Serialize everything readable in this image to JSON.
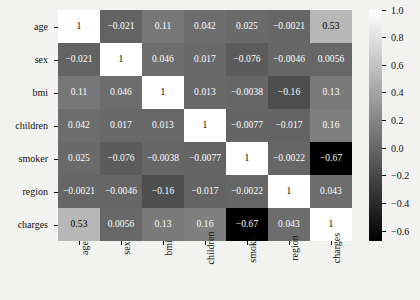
{
  "chart_data": {
    "type": "heatmap",
    "title": "",
    "xlabel": "",
    "ylabel": "",
    "grid": false,
    "colormap": "grayscale",
    "colorbar": {
      "position": "right",
      "orientation": "vertical",
      "vmin": -0.67,
      "vmax": 1.0,
      "ticks": [
        "1.0",
        "0.8",
        "0.6",
        "0.4",
        "0.2",
        "0.0",
        "−0.2",
        "−0.4",
        "−0.6"
      ],
      "tick_values": [
        1.0,
        0.8,
        0.6,
        0.4,
        0.2,
        0.0,
        -0.2,
        -0.4,
        -0.6
      ]
    },
    "categories": [
      "age",
      "sex",
      "bmi",
      "children",
      "smoker",
      "region",
      "charges"
    ],
    "xticklabels": [
      "age",
      "sex",
      "bmi",
      "children",
      "smoker",
      "region",
      "charges"
    ],
    "yticklabels": [
      "age",
      "sex",
      "bmi",
      "children",
      "smoker",
      "region",
      "charges"
    ],
    "values": [
      [
        1,
        -0.021,
        0.11,
        0.042,
        0.025,
        -0.0021,
        0.53
      ],
      [
        -0.021,
        1,
        0.046,
        0.017,
        -0.076,
        -0.0046,
        0.0056
      ],
      [
        0.11,
        0.046,
        1,
        0.013,
        -0.0038,
        -0.16,
        0.13
      ],
      [
        0.042,
        0.017,
        0.013,
        1,
        -0.0077,
        -0.017,
        0.16
      ],
      [
        0.025,
        -0.076,
        -0.0038,
        -0.0077,
        1,
        -0.0022,
        -0.67
      ],
      [
        -0.0021,
        -0.0046,
        -0.16,
        -0.017,
        -0.0022,
        1,
        0.043
      ],
      [
        0.53,
        0.0056,
        0.13,
        0.16,
        -0.67,
        0.043,
        1
      ]
    ],
    "annotations": [
      [
        "1",
        "−0.021",
        "0.11",
        "0.042",
        "0.025",
        "−0.0021",
        "0.53"
      ],
      [
        "−0.021",
        "1",
        "0.046",
        "0.017",
        "−0.076",
        "−0.0046",
        "0.0056"
      ],
      [
        "0.11",
        "0.046",
        "1",
        "0.013",
        "−0.0038",
        "−0.16",
        "0.13"
      ],
      [
        "0.042",
        "0.017",
        "0.013",
        "1",
        "−0.0077",
        "−0.017",
        "0.16"
      ],
      [
        "0.025",
        "−0.076",
        "−0.0038",
        "−0.0077",
        "1",
        "−0.0022",
        "−0.67"
      ],
      [
        "−0.0021",
        "−0.0046",
        "−0.16",
        "−0.017",
        "−0.0022",
        "1",
        "0.043"
      ],
      [
        "0.53",
        "0.0056",
        "0.13",
        "0.16",
        "−0.67",
        "0.043",
        "1"
      ]
    ]
  },
  "colors": {
    "background": "#f2f2f0",
    "text": "#111111",
    "cell_text_dark": "#000000",
    "cell_text_light": "#ffffff"
  }
}
